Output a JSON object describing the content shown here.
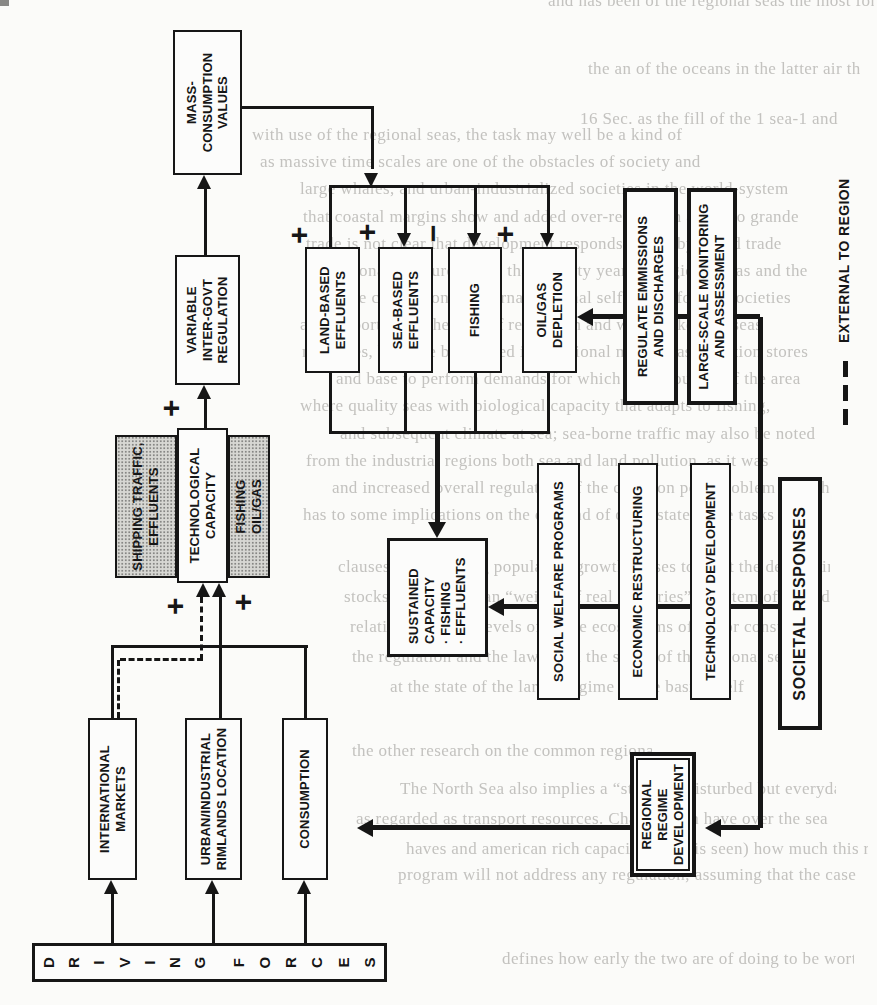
{
  "figure": {
    "type": "flow-diagram",
    "orientation": "diagram rotated 90° counter-clockwise on a scanned book page"
  },
  "nodes": {
    "driving_forces": {
      "word1": [
        "D",
        "R",
        "I",
        "V",
        "I",
        "N",
        "G"
      ],
      "word2": [
        "F",
        "O",
        "R",
        "C",
        "E",
        "S"
      ]
    },
    "international_markets": [
      "INTERNATIONAL",
      "MARKETS"
    ],
    "urban_industrial": [
      "URBAN/INDUSTRIAL",
      "RIMLANDS LOCATION"
    ],
    "consumption": [
      "CONSUMPTION"
    ],
    "shipping_traffic": [
      "SHIPPING TRAFFIC,",
      "EFFLUENTS"
    ],
    "technological_capacity": [
      "TECHNOLOGICAL",
      "CAPACITY"
    ],
    "fishing_oilgas": [
      "FISHING",
      "OIL/GAS"
    ],
    "variable_regulation": [
      "VARIABLE",
      "INTER-GOVT",
      "REGULATION"
    ],
    "mass_consumption": [
      "MASS-",
      "CONSUMPTION",
      "VALUES"
    ],
    "land_based": [
      "LAND-BASED",
      "EFFLUENTS"
    ],
    "sea_based": [
      "SEA-BASED",
      "EFFLUENTS"
    ],
    "fishing": [
      "FISHING"
    ],
    "oilgas_depletion": [
      "OIL/GAS",
      "DEPLETION"
    ],
    "sustained_capacity": [
      "SUSTAINED",
      "CAPACITY",
      "· FISHING",
      "· EFFLUENTS"
    ],
    "regulate_emissions": [
      "REGULATE EMMISSIONS",
      "AND DISCHARGES"
    ],
    "large_scale_monitoring": [
      "LARGE-SCALE MONITORING",
      "AND ASSESSMENT"
    ],
    "social_welfare": [
      "SOCIAL WELFARE PROGRAMS"
    ],
    "economic_restructuring": [
      "ECONOMIC RESTRUCTURING"
    ],
    "technology_development": [
      "TECHNOLOGY DEVELOPMENT"
    ],
    "societal_responses": [
      "SOCIETAL RESPONSES"
    ],
    "regional_regime": [
      "REGIONAL",
      "REGIME",
      "DEVELOPMENT"
    ]
  },
  "signs": {
    "plus": "+",
    "minus": "−"
  },
  "legend": {
    "dashed_line_label": "EXTERNAL TO REGION"
  },
  "colors": {
    "ink": "#161616",
    "paper": "#fbfbf9",
    "gray_fill": "#d7d7d3",
    "ghost_text": "#c3c2bf"
  },
  "ghost_text_lines": [
    "and has been of the regional seas the most for",
    "the an of the oceans in the latter air the rest",
    "16 Sec. as the fill of the 1 sea-1 and",
    "with use of the regional seas, the task may well be a kind of",
    "as massive time scales are one of the obstacles of society and",
    "large whales, and urban-industrialized societies in the world-system",
    "that coastal margins show and added over-regulation and also grande",
    "trade is not clear that development responds to nearby world trade",
    "national pressures more than twenty years in regional seas and the",
    "negative conclusion of internal regional self-report for the societies",
    "also important as the area of regulation and what makes the seas",
    "measures, both the broadened international markets as pollution stores",
    "and base to perform demands for which the resources of the area",
    "where quality seas with biological capacity that adapts to fishing,",
    "and subsequent climate at sea; sea-borne traffic may also be noted",
    "from the industrial regions both sea and land pollution, as it was",
    "and increased overall regulation of the common pool problem (which",
    "has to some implications on the demand of other states. The tasks can,",
    "clauses but emerging population growth ceases to meet the developing",
    "stocks and rights than “weight of real countries” a system of an end",
    "relations with the levels of entire ecosystems of major consumption",
    "the regulation and the law of all the states of the regional sea",
    "at the state of the larger regime of the basin itself",
    "the other research on the common regional seas are",
    "The North Sea also implies a “state” of disturbed but everyday",
    "as regarded as transport resources. Changes can have over the sea",
    "haves and american rich capacity or (as is seen) how much this regularly",
    "program will not address any regulation; assuming that the case",
    "defines how early the two are of doing to be worth the cost"
  ]
}
